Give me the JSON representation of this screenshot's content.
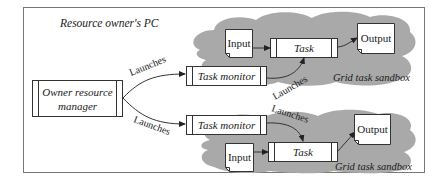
{
  "diagram": {
    "frame_title": "Resource owner's PC",
    "owner_manager": {
      "line1": "Owner resource",
      "line2": "manager"
    },
    "top": {
      "task_monitor": "Task monitor",
      "input": "Input",
      "task": "Task",
      "output": "Output",
      "sandbox_label": "Grid task sandbox",
      "launches_from_manager": "Launches",
      "launches_from_monitor": "Launches"
    },
    "bottom": {
      "task_monitor": "Task monitor",
      "input": "Input",
      "task": "Task",
      "output": "Output",
      "sandbox_label": "Grid task sandbox",
      "launches_from_manager": "Launches",
      "launches_from_monitor": "Launches"
    },
    "colors": {
      "sandbox_fill": "#a9a9a9",
      "stroke": "#333333",
      "frame": "#777777"
    }
  }
}
